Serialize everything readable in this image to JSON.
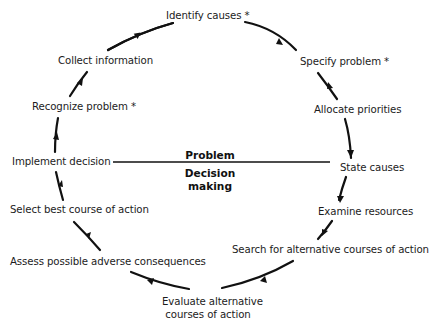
{
  "diagram": {
    "type": "cycle",
    "center": {
      "top_label": "Problem",
      "bottom_label_line1": "Decision",
      "bottom_label_line2": "making"
    },
    "steps": [
      {
        "id": "identify-causes",
        "label": "Identify causes *"
      },
      {
        "id": "specify-problem",
        "label": "Specify problem *"
      },
      {
        "id": "allocate-priorities",
        "label": "Allocate priorities"
      },
      {
        "id": "state-causes",
        "label": "State causes"
      },
      {
        "id": "examine-resources",
        "label": "Examine resources"
      },
      {
        "id": "search-alternatives",
        "label": "Search for alternative courses of action"
      },
      {
        "id": "evaluate-alternatives",
        "label_line1": "Evaluate alternative",
        "label_line2": "courses of action"
      },
      {
        "id": "assess-consequences",
        "label": "Assess possible adverse consequences"
      },
      {
        "id": "select-best",
        "label": "Select best course of action"
      },
      {
        "id": "implement-decision",
        "label": "Implement decision"
      },
      {
        "id": "recognize-problem",
        "label": "Recognize problem *"
      },
      {
        "id": "collect-information",
        "label": "Collect information"
      }
    ],
    "flow_direction": "clockwise",
    "colors": {
      "arrow": "#111111",
      "text": "#1c1c1c",
      "background": "#ffffff"
    }
  }
}
